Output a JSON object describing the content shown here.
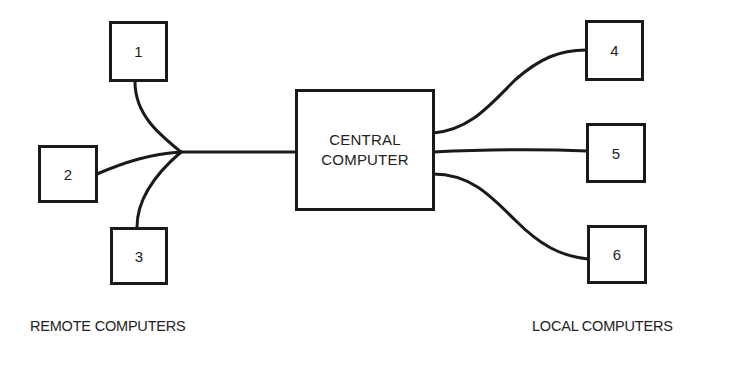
{
  "diagram": {
    "central": {
      "line1": "CENTRAL",
      "line2": "COMPUTER"
    },
    "remote_nodes": [
      {
        "label": "1"
      },
      {
        "label": "2"
      },
      {
        "label": "3"
      }
    ],
    "local_nodes": [
      {
        "label": "4"
      },
      {
        "label": "5"
      },
      {
        "label": "6"
      }
    ],
    "captions": {
      "remote": "REMOTE COMPUTERS",
      "local": "LOCAL COMPUTERS"
    },
    "edges": [
      {
        "from": "1",
        "to": "junction"
      },
      {
        "from": "2",
        "to": "junction"
      },
      {
        "from": "3",
        "to": "junction"
      },
      {
        "from": "junction",
        "to": "central"
      },
      {
        "from": "central",
        "to": "4"
      },
      {
        "from": "central",
        "to": "5"
      },
      {
        "from": "central",
        "to": "6"
      }
    ]
  }
}
